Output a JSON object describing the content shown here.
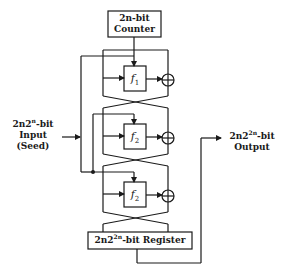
{
  "diagram": {
    "counter": {
      "line1": "2n-bit",
      "line2": "Counter"
    },
    "input": {
      "line1_pre": "2n2",
      "line1_sup": "n",
      "line1_post": "-bit",
      "line2": "Input",
      "line3": "(Seed)"
    },
    "output": {
      "line1_pre": "2n2",
      "line1_sup": "2n",
      "line1_post": "-bit",
      "line2": "Output"
    },
    "register": {
      "pre": "2n2",
      "sup": "2n",
      "post": "-bit Register"
    },
    "stages": [
      {
        "func": "f",
        "sub": "1"
      },
      {
        "func": "f",
        "sub": "2"
      },
      {
        "func": "f",
        "sub": "2"
      }
    ],
    "xor_symbol": "⊕",
    "colors": {
      "line": "#1a1a1a",
      "background": "#ffffff"
    }
  }
}
